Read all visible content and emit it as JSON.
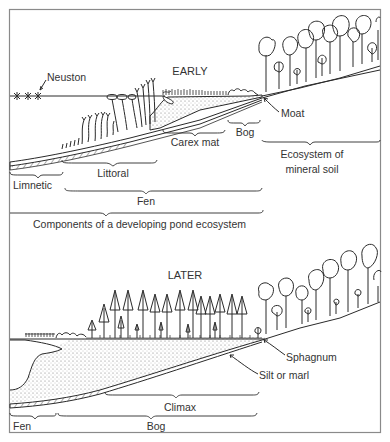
{
  "figure": {
    "caption": "Components of a developing pond ecosystem",
    "colors": {
      "ink": "#2a2a2a",
      "frame": "#8a8a8a",
      "sediment_fill": "#d8d8d8",
      "paper": "#ffffff"
    }
  },
  "early_panel": {
    "title": "EARLY",
    "annotations": {
      "neuston": "Neuston",
      "moat": "Moat"
    },
    "zones": [
      {
        "label": "Limnetic"
      },
      {
        "label": "Littoral"
      },
      {
        "label": "Carex mat"
      },
      {
        "label": "Bog"
      },
      {
        "label": "Ecosystem of mineral soil"
      },
      {
        "label": "Fen"
      }
    ]
  },
  "later_panel": {
    "title": "LATER",
    "annotations": {
      "sphagnum": "Sphagnum",
      "silt": "Silt or marl"
    },
    "zones": [
      {
        "label": "Climax"
      },
      {
        "label": "Fen"
      },
      {
        "label": "Bog"
      }
    ]
  }
}
